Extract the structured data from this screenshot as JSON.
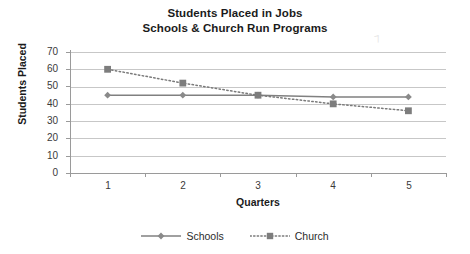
{
  "chart_data": {
    "type": "line",
    "title": "Students Placed in Jobs",
    "subtitle": "Schools & Church Run Programs",
    "xlabel": "Quarters",
    "ylabel": "Students Placed",
    "categories": [
      "1",
      "2",
      "3",
      "4",
      "5"
    ],
    "yticks": [
      "70",
      "60",
      "50",
      "40",
      "30",
      "20",
      "10",
      "0"
    ],
    "ylim": [
      0,
      70
    ],
    "ystep": 10,
    "grid": "horizontal",
    "legend_position": "bottom",
    "series": [
      {
        "name": "Schools",
        "values": [
          45,
          45,
          45,
          44,
          44
        ],
        "marker": "diamond",
        "linestyle": "solid",
        "color": "#808080"
      },
      {
        "name": "Church",
        "values": [
          60,
          52,
          45,
          40,
          36
        ],
        "marker": "square",
        "linestyle": "dotted",
        "color": "#7a7a7a"
      }
    ]
  },
  "colors": {
    "axis": "#9a9a9a",
    "gridline": "#c7c7c7",
    "text": "#231f20",
    "series_schools": "#808080",
    "series_church": "#7a7a7a",
    "background": "#ffffff"
  },
  "artifact": {
    "glyph": "⁊"
  }
}
